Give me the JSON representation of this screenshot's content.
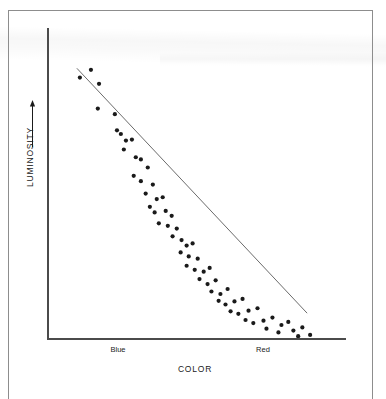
{
  "figure": {
    "axes": {
      "x_title": "COLOR",
      "y_title": "LUMINOSITY",
      "y_arrow_icon": "up-arrow-icon",
      "x_tick_labels": [
        "Blue",
        "Red"
      ]
    },
    "colors": {
      "axis": "#4b4b4b",
      "point": "#1a1a1a",
      "trendline": "#6b6b6b",
      "frame": "#8d8d8d",
      "background": "#ffffff"
    }
  },
  "chart_data": {
    "type": "scatter",
    "title": "",
    "xlabel": "COLOR",
    "ylabel": "LUMINOSITY",
    "xlim": [
      0,
      100
    ],
    "ylim": [
      0,
      100
    ],
    "grid": false,
    "legend": null,
    "xtick_positions": [
      24,
      72
    ],
    "xtick_labels": [
      "Blue",
      "Red"
    ],
    "ytick_labels": [],
    "trendline": {
      "type": "linear-fit",
      "x": [
        10,
        87
      ],
      "y": [
        87,
        8
      ]
    },
    "points": [
      {
        "x": 11.0,
        "y": 84.0
      },
      {
        "x": 14.7,
        "y": 86.5
      },
      {
        "x": 17.4,
        "y": 82.0
      },
      {
        "x": 17.0,
        "y": 74.0
      },
      {
        "x": 22.7,
        "y": 72.2
      },
      {
        "x": 23.4,
        "y": 67.0
      },
      {
        "x": 24.7,
        "y": 65.8
      },
      {
        "x": 26.4,
        "y": 63.7
      },
      {
        "x": 28.4,
        "y": 64.0
      },
      {
        "x": 25.7,
        "y": 60.8
      },
      {
        "x": 29.7,
        "y": 58.3
      },
      {
        "x": 31.4,
        "y": 57.6
      },
      {
        "x": 33.7,
        "y": 55.0
      },
      {
        "x": 29.0,
        "y": 52.3
      },
      {
        "x": 31.4,
        "y": 50.6
      },
      {
        "x": 35.4,
        "y": 49.5
      },
      {
        "x": 33.0,
        "y": 46.6
      },
      {
        "x": 36.7,
        "y": 44.8
      },
      {
        "x": 38.7,
        "y": 45.4
      },
      {
        "x": 34.4,
        "y": 42.3
      },
      {
        "x": 36.0,
        "y": 40.5
      },
      {
        "x": 39.7,
        "y": 41.0
      },
      {
        "x": 41.7,
        "y": 39.4
      },
      {
        "x": 37.4,
        "y": 37.0
      },
      {
        "x": 40.4,
        "y": 36.2
      },
      {
        "x": 43.4,
        "y": 35.3
      },
      {
        "x": 42.0,
        "y": 32.8
      },
      {
        "x": 45.0,
        "y": 31.6
      },
      {
        "x": 46.7,
        "y": 29.8
      },
      {
        "x": 48.7,
        "y": 30.5
      },
      {
        "x": 44.7,
        "y": 27.6
      },
      {
        "x": 47.4,
        "y": 26.3
      },
      {
        "x": 50.4,
        "y": 25.6
      },
      {
        "x": 46.7,
        "y": 23.3
      },
      {
        "x": 49.4,
        "y": 22.0
      },
      {
        "x": 52.4,
        "y": 21.4
      },
      {
        "x": 54.4,
        "y": 22.6
      },
      {
        "x": 51.0,
        "y": 19.0
      },
      {
        "x": 53.7,
        "y": 17.4
      },
      {
        "x": 56.4,
        "y": 18.6
      },
      {
        "x": 55.0,
        "y": 15.0
      },
      {
        "x": 58.0,
        "y": 14.2
      },
      {
        "x": 60.4,
        "y": 15.8
      },
      {
        "x": 57.4,
        "y": 12.0
      },
      {
        "x": 59.7,
        "y": 10.8
      },
      {
        "x": 62.7,
        "y": 11.8
      },
      {
        "x": 65.4,
        "y": 12.6
      },
      {
        "x": 61.4,
        "y": 8.6
      },
      {
        "x": 64.0,
        "y": 7.8
      },
      {
        "x": 67.4,
        "y": 8.8
      },
      {
        "x": 70.4,
        "y": 9.6
      },
      {
        "x": 66.4,
        "y": 5.8
      },
      {
        "x": 69.0,
        "y": 4.8
      },
      {
        "x": 72.4,
        "y": 5.6
      },
      {
        "x": 75.4,
        "y": 6.6
      },
      {
        "x": 73.4,
        "y": 3.0
      },
      {
        "x": 78.4,
        "y": 4.2
      },
      {
        "x": 80.7,
        "y": 5.2
      },
      {
        "x": 77.4,
        "y": 1.8
      },
      {
        "x": 82.4,
        "y": 2.4
      },
      {
        "x": 85.4,
        "y": 3.4
      },
      {
        "x": 84.0,
        "y": 0.6
      },
      {
        "x": 88.0,
        "y": 1.0
      }
    ]
  }
}
